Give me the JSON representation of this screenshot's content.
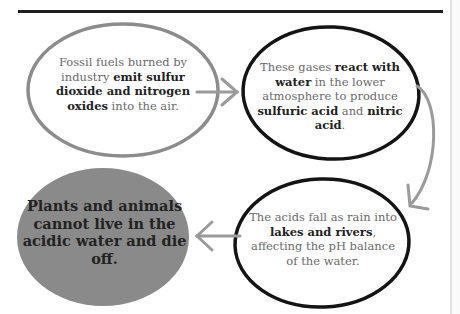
{
  "diagram": {
    "type": "cycle-flow",
    "topic": "Acid rain process",
    "nodes": [
      {
        "id": "emission",
        "style": "gray-outline",
        "parts": [
          {
            "text": "Fossil fuels burned by industry ",
            "bold": false
          },
          {
            "text": "emit sulfur dioxide and nitrogen oxides",
            "bold": true
          },
          {
            "text": " into the air.",
            "bold": false
          }
        ]
      },
      {
        "id": "reaction",
        "style": "black-outline",
        "parts": [
          {
            "text": "These gases ",
            "bold": false
          },
          {
            "text": "react with water",
            "bold": true
          },
          {
            "text": " in the lower atmosphere to produce ",
            "bold": false
          },
          {
            "text": "sulfuric acid",
            "bold": true
          },
          {
            "text": " and ",
            "bold": false
          },
          {
            "text": "nitric acid",
            "bold": true
          },
          {
            "text": ".",
            "bold": false
          }
        ]
      },
      {
        "id": "rainfall",
        "style": "black-outline",
        "parts": [
          {
            "text": "The acids fall as rain into ",
            "bold": false
          },
          {
            "text": "lakes and rivers",
            "bold": true
          },
          {
            "text": ", affecting the pH balance of the water.",
            "bold": false
          }
        ]
      },
      {
        "id": "outcome",
        "style": "gray-filled",
        "parts": [
          {
            "text": "Plants and animals cannot live in the acidic water and die off.",
            "bold": true
          }
        ]
      }
    ],
    "edges": [
      {
        "from": "emission",
        "to": "reaction",
        "direction": "right"
      },
      {
        "from": "reaction",
        "to": "rainfall",
        "direction": "curved-down"
      },
      {
        "from": "rainfall",
        "to": "outcome",
        "direction": "left"
      }
    ],
    "colors": {
      "rule": "#1e1e1e",
      "gray_outline": "#8c8c8c",
      "black_outline": "#141414",
      "arrow": "#9a9a9a",
      "filled": "#8a8a8a",
      "text_light": "#6a6a6a",
      "text_bold": "#222222"
    }
  }
}
